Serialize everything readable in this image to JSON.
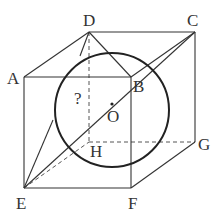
{
  "diagram": {
    "type": "geometry-cube-with-inscribed-sphere",
    "vertices": {
      "A": {
        "label": "A",
        "x": 24,
        "y": 77
      },
      "B": {
        "label": "B",
        "x": 131,
        "y": 77
      },
      "C": {
        "label": "C",
        "x": 195,
        "y": 32
      },
      "D": {
        "label": "D",
        "x": 89,
        "y": 32
      },
      "E": {
        "label": "E",
        "x": 24,
        "y": 188
      },
      "F": {
        "label": "F",
        "x": 131,
        "y": 188
      },
      "G": {
        "label": "G",
        "x": 195,
        "y": 142
      },
      "H": {
        "label": "H",
        "x": 89,
        "y": 142
      }
    },
    "center": {
      "label": "O",
      "x": 112,
      "y": 110
    },
    "unknown_marker": "?",
    "sphere_radius_px": 57,
    "colors": {
      "line": "#333333",
      "background": "#ffffff"
    }
  }
}
